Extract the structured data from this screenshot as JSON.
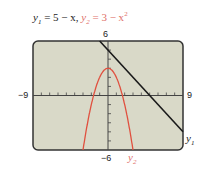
{
  "title": {
    "y1_label": "y",
    "y1_sub": "1",
    "y1_expr": " = 5 − x,",
    "y2_label": "y",
    "y2_sub": "2",
    "y2_expr": " = 3 − x",
    "y2_exp": "2"
  },
  "axes": {
    "xmin_label": "−9",
    "xmax_label": "9",
    "ymax_label": "6",
    "ymin_label": "−6"
  },
  "curve_labels": {
    "y1": "y",
    "y1_sub": "1",
    "y2": "y",
    "y2_sub": "2"
  },
  "colors": {
    "y1": "#1a1a1a",
    "y2": "#e0503f",
    "screen_bg": "#d9d9c8",
    "frame": "#333333"
  },
  "chart_data": {
    "type": "line",
    "xlabel": "",
    "ylabel": "",
    "xlim": [
      -9,
      9
    ],
    "ylim": [
      -6,
      6
    ],
    "xticks_step": 1,
    "yticks_step": 1,
    "grid": false,
    "series": [
      {
        "name": "y1",
        "expression": "5 - x",
        "color": "#1a1a1a",
        "x": [
          -1,
          0,
          2,
          5,
          9
        ],
        "y": [
          6,
          5,
          3,
          0,
          -4
        ]
      },
      {
        "name": "y2",
        "expression": "3 - x^2",
        "color": "#e0503f",
        "x": [
          -3,
          -2,
          -1,
          0,
          1,
          2,
          3
        ],
        "y": [
          -6,
          -1,
          2,
          3,
          2,
          -1,
          -6
        ]
      }
    ],
    "annotations": [
      "y1 label at right end of line",
      "y2 label below right branch of parabola"
    ]
  }
}
